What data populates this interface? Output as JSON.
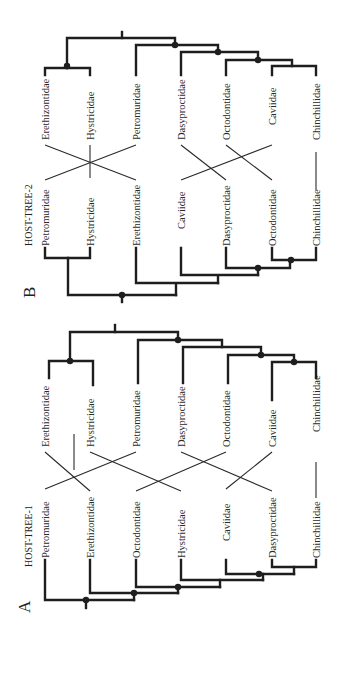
{
  "figure": {
    "orientation": "rotated 90 degrees counter-clockwise",
    "panels": [
      {
        "id": "A",
        "letter": "A",
        "title": "HOST-TREE-1",
        "host_taxa": [
          "Petromuridae",
          "Erethizontidae",
          "Octodontidae",
          "Hystricidae",
          "Caviidae",
          "Dasyproctidae",
          "Chinchillidae"
        ],
        "parasite_taxa": [
          "Erethizontidae",
          "Hystricidae",
          "Petromuridae",
          "Dasyproctidae",
          "Octodontidae",
          "Caviidae",
          "Chinchillidae"
        ],
        "associations": [
          [
            "Petromuridae",
            "Petromuridae"
          ],
          [
            "Erethizontidae",
            "Erethizontidae"
          ],
          [
            "Octodontidae",
            "Octodontidae"
          ],
          [
            "Hystricidae",
            "Hystricidae"
          ],
          [
            "Caviidae",
            "Caviidae"
          ],
          [
            "Dasyproctidae",
            "Dasyproctidae"
          ],
          [
            "Chinchillidae",
            "Chinchillidae"
          ]
        ]
      },
      {
        "id": "B",
        "letter": "B",
        "title": "HOST-TREE-2",
        "host_taxa": [
          "Petromuridae",
          "Hystricidae",
          "Erethizontidae",
          "Caviidae",
          "Dasyproctidae",
          "Octodontidae",
          "Chinchillidae"
        ],
        "parasite_taxa": [
          "Erethizontidae",
          "Hystricidae",
          "Petromuridae",
          "Dasyproctidae",
          "Octodontidae",
          "Caviidae",
          "Chinchillidae"
        ],
        "associations": [
          [
            "Petromuridae",
            "Petromuridae"
          ],
          [
            "Hystricidae",
            "Hystricidae"
          ],
          [
            "Erethizontidae",
            "Erethizontidae"
          ],
          [
            "Caviidae",
            "Caviidae"
          ],
          [
            "Dasyproctidae",
            "Dasyproctidae"
          ],
          [
            "Octodontidae",
            "Octodontidae"
          ],
          [
            "Chinchillidae",
            "Chinchillidae"
          ]
        ]
      }
    ]
  },
  "panelA": {
    "letter": "A",
    "title": "HOST-TREE-1",
    "host": [
      "Petromuridae",
      "Erethizontidae",
      "Octodontidae",
      "Hystricidae",
      "Caviidae",
      "Dasyproctidae",
      "Chinchillidae"
    ],
    "parasite": [
      "Erethizontidae",
      "Hystricidae",
      "Petromuridae",
      "Dasyproctidae",
      "Octodontidae",
      "Caviidae",
      "Chinchillidae"
    ]
  },
  "panelB": {
    "letter": "B",
    "title": "HOST-TREE-2",
    "host": [
      "Petromuridae",
      "Hystricidae",
      "Erethizontidae",
      "Caviidae",
      "Dasyproctidae",
      "Octodontidae",
      "Chinchillidae"
    ],
    "parasite": [
      "Erethizontidae",
      "Hystricidae",
      "Petromuridae",
      "Dasyproctidae",
      "Octodontidae",
      "Caviidae",
      "Chinchillidae"
    ]
  },
  "colors": {
    "line": "#1e1e1e",
    "text": "#2a2a2a",
    "background": "#ffffff"
  }
}
